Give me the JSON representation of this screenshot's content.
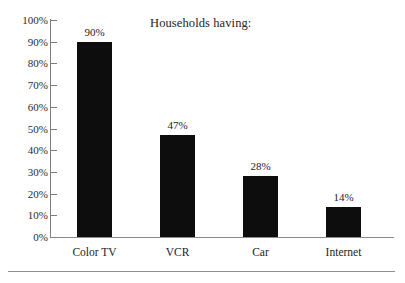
{
  "chart_data": {
    "type": "bar",
    "title": "Households having:",
    "xlabel": "",
    "ylabel": "",
    "categories": [
      "Color TV",
      "VCR",
      "Car",
      "Internet"
    ],
    "values": [
      90,
      47,
      28,
      14
    ],
    "value_labels": [
      "90%",
      "47%",
      "28%",
      "14%"
    ],
    "ylim": [
      0,
      100
    ],
    "ytick_values": [
      0,
      10,
      20,
      30,
      40,
      50,
      60,
      70,
      80,
      90,
      100
    ],
    "ytick_labels": [
      "0%",
      "10%",
      "20%",
      "30%",
      "40%",
      "50%",
      "60%",
      "70%",
      "80%",
      "90%",
      "100%"
    ],
    "grid": false,
    "legend": "none",
    "bar_color": "#0d0d0d",
    "axis_color": "#7d7d7d"
  },
  "figure": {
    "footer_rule": true
  }
}
